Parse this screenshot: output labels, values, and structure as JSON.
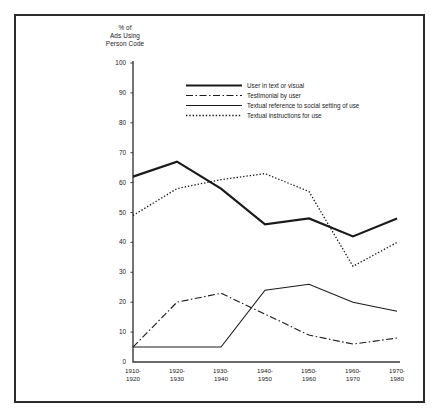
{
  "figure": {
    "axis_title": "% of Ads Using Person Code"
  },
  "legend": {
    "items": [
      {
        "label": "User in text or visual",
        "style": "thick-solid",
        "color": "#1a1a1a"
      },
      {
        "label": "Testimonial by user",
        "style": "dash-dot",
        "color": "#1a1a1a"
      },
      {
        "label": "Textual reference to social setting of use",
        "style": "thin-solid",
        "color": "#1a1a1a"
      },
      {
        "label": "Textual instructions for use",
        "style": "dotted",
        "color": "#1a1a1a"
      }
    ]
  },
  "chart_data": {
    "type": "line",
    "title": "% of Ads Using Person Code",
    "xlabel": "",
    "ylabel": "% of Ads Using Person Code",
    "ylim": [
      0,
      100
    ],
    "yticks": [
      0,
      10,
      20,
      30,
      40,
      50,
      60,
      70,
      80,
      90,
      100
    ],
    "ytick_labels": [
      "0",
      "10",
      "20",
      "30",
      "40",
      "50",
      "60",
      "70",
      "80",
      "90",
      "100"
    ],
    "grid": false,
    "legend_position": "upper-center",
    "categories": [
      "1910-\n1920",
      "1920-\n1930",
      "1930-\n1940",
      "1940-\n1950",
      "1950-\n1960",
      "1960-\n1970",
      "1970-\n1980"
    ],
    "categories_flat": [
      "1910-1920",
      "1920-1930",
      "1930-1940",
      "1940-1950",
      "1950-1960",
      "1960-1970",
      "1970-1980"
    ],
    "series": [
      {
        "name": "User in text or visual",
        "style": "thick-solid",
        "color": "#1a1a1a",
        "values": [
          62,
          67,
          58,
          46,
          48,
          42,
          48
        ]
      },
      {
        "name": "Testimonial by user",
        "style": "dash-dot",
        "color": "#1a1a1a",
        "values": [
          5,
          20,
          23,
          16,
          9,
          6,
          8
        ]
      },
      {
        "name": "Textual reference to social setting of use",
        "style": "thin-solid",
        "color": "#1a1a1a",
        "values": [
          5,
          5,
          5,
          24,
          26,
          20,
          17
        ]
      },
      {
        "name": "Textual instructions for use",
        "style": "dotted",
        "color": "#1a1a1a",
        "values": [
          49,
          58,
          61,
          63,
          57,
          32,
          40
        ]
      }
    ]
  }
}
